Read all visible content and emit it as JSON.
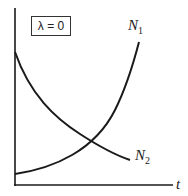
{
  "legend_box": {
    "text": "λ = 0"
  },
  "curves": [
    {
      "name": "N1",
      "label_main": "N",
      "label_sub": "1",
      "shape": "increasing"
    },
    {
      "name": "N2",
      "label_main": "N",
      "label_sub": "2",
      "shape": "decreasing"
    }
  ],
  "axes": {
    "x_label": "t",
    "y_label": ""
  },
  "colors": {
    "line": "#1a1a1a",
    "background": "#ffffff"
  }
}
